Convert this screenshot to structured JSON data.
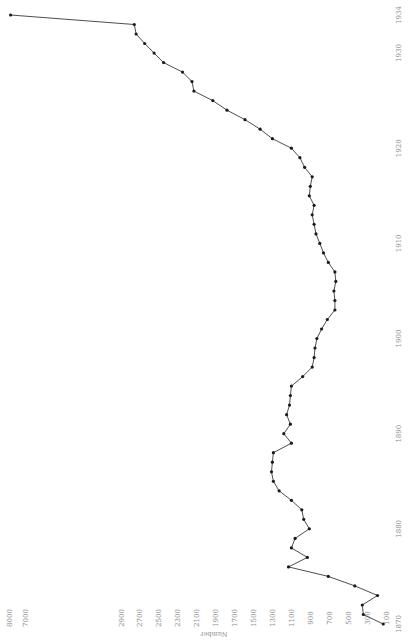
{
  "chart_data": {
    "type": "line",
    "orientation": "rotated-90-ccw",
    "title": "",
    "xlabel": "",
    "ylabel": "Number",
    "x_ticks": [
      1870,
      1880,
      1890,
      1900,
      1910,
      1920,
      1930,
      1934
    ],
    "y_ticks": [
      100,
      300,
      500,
      700,
      900,
      1100,
      1300,
      1500,
      1700,
      1900,
      2100,
      2300,
      2500,
      2700,
      2900,
      7000,
      8000
    ],
    "y_tick_labels": [
      "100",
      "300",
      "500",
      "700",
      "900",
      "1100",
      "1300",
      "1500",
      "1700",
      "1900",
      "2100",
      "2300",
      "2500",
      "2700",
      "2900",
      "7000",
      "8000"
    ],
    "y_axis_break": [
      2900,
      7000
    ],
    "xlim": [
      1870,
      1934
    ],
    "ylim": [
      100,
      8000
    ],
    "grid": false,
    "legend": null,
    "series": [
      {
        "name": "Number",
        "color": "#1a1a1a",
        "x": [
          1870,
          1871,
          1872,
          1873,
          1874,
          1875,
          1876,
          1877,
          1878,
          1879,
          1880,
          1881,
          1882,
          1883,
          1884,
          1885,
          1886,
          1887,
          1888,
          1889,
          1890,
          1891,
          1892,
          1893,
          1894,
          1895,
          1896,
          1897,
          1898,
          1899,
          1900,
          1901,
          1902,
          1903,
          1904,
          1905,
          1906,
          1907,
          1908,
          1909,
          1910,
          1911,
          1912,
          1913,
          1914,
          1915,
          1916,
          1917,
          1918,
          1919,
          1920,
          1921,
          1922,
          1923,
          1924,
          1925,
          1926,
          1927,
          1928,
          1929,
          1930,
          1931,
          1932,
          1933,
          1934
        ],
        "values": [
          130,
          340,
          350,
          190,
          430,
          710,
          1130,
          930,
          1100,
          1060,
          910,
          970,
          990,
          1100,
          1230,
          1290,
          1310,
          1300,
          1290,
          1100,
          1180,
          1110,
          1150,
          1120,
          1110,
          1100,
          980,
          880,
          860,
          850,
          830,
          780,
          720,
          640,
          640,
          650,
          630,
          640,
          710,
          760,
          800,
          840,
          860,
          880,
          860,
          910,
          900,
          880,
          960,
          1010,
          1100,
          1300,
          1430,
          1590,
          1780,
          1930,
          2130,
          2150,
          2250,
          2450,
          2550,
          2650,
          2740,
          2760,
          7900
        ]
      }
    ]
  },
  "axis": {
    "y_title": "Number"
  }
}
